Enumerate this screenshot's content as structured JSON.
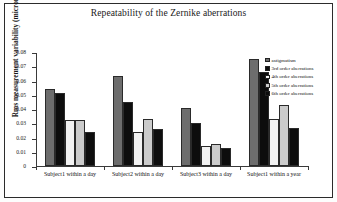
{
  "figure": {
    "border_color": "#2b2b2b",
    "background": "#ffffff"
  },
  "chart_data": {
    "type": "bar",
    "title": "Repeatability of the Zernike aberrations",
    "xlabel": "",
    "ylabel": "Rms measurement variability (microns)",
    "ylim": [
      0,
      0.08
    ],
    "ytick_labels": [
      "0.08",
      "0.07",
      "0.06",
      "0.05",
      "0.04",
      "0.03",
      "0.02",
      "0.01",
      "0"
    ],
    "ytick_values": [
      0.08,
      0.07,
      0.06,
      0.05,
      0.04,
      0.03,
      0.02,
      0.01,
      0
    ],
    "grid": false,
    "legend_position": "right",
    "categories": [
      "Subject1  within a day",
      "Subject2 within a day",
      "Subject3 within a day",
      "Subject1  within a year"
    ],
    "series": [
      {
        "name": "astigmatism",
        "color": "#6d6d6d",
        "values": [
          0.054,
          0.063,
          0.041,
          0.075
        ]
      },
      {
        "name": "3rd order aberrations",
        "color": "#0d0d0d",
        "values": [
          0.051,
          0.045,
          0.03,
          0.066
        ]
      },
      {
        "name": "4th order aberrations",
        "color": "#f2f2f2",
        "values": [
          0.032,
          0.024,
          0.014,
          0.033
        ]
      },
      {
        "name": "5th order aberrations",
        "color": "#cbcbcb",
        "values": [
          0.032,
          0.033,
          0.0155,
          0.043
        ]
      },
      {
        "name": "6th order aberrations",
        "color": "#0d0d0d",
        "values": [
          0.024,
          0.026,
          0.0125,
          0.0265
        ]
      }
    ]
  }
}
